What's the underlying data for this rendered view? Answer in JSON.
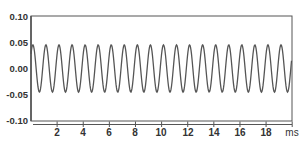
{
  "chart_data": {
    "type": "line",
    "title": "",
    "xlabel": "ms",
    "ylabel": "",
    "xlim": [
      0,
      20
    ],
    "ylim": [
      -0.1,
      0.1
    ],
    "x_ticks": [
      2,
      4,
      6,
      8,
      10,
      12,
      14,
      16,
      18
    ],
    "x_tick_labels": [
      "2",
      "4",
      "6",
      "8",
      "10",
      "12",
      "14",
      "16",
      "18"
    ],
    "x_unit_label": "ms",
    "y_ticks": [
      0.1,
      0.05,
      0.0,
      -0.05,
      -0.1
    ],
    "y_tick_labels": [
      "0.10",
      "0.05",
      "0.00",
      "-0.05",
      "-0.10"
    ],
    "grid": false,
    "legend": null,
    "series": [
      {
        "name": "signal",
        "kind": "sine",
        "amplitude": 0.045,
        "frequency_khz": 1.0,
        "period_ms": 1.0,
        "offset": 0.0,
        "cycles_shown": 20,
        "x_start_ms": 0,
        "x_end_ms": 20,
        "color": "#555555"
      }
    ]
  },
  "colors": {
    "frame": "#555555",
    "trace": "#555555",
    "text": "#333333",
    "background": "#ffffff"
  }
}
